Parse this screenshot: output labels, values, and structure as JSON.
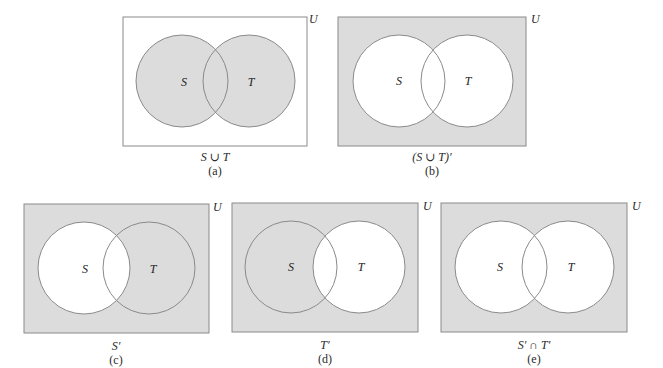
{
  "colors": {
    "shade": "#dcdcdc",
    "white": "#ffffff",
    "stroke": "#8a8a8a",
    "text": "#2a2a2a"
  },
  "universe_label": "U",
  "set_labels": {
    "s": "S",
    "t": "T"
  },
  "diagrams": [
    {
      "id": "a",
      "expression": "S ∪ T",
      "caption": "(a)",
      "shaded_regions": [
        "S only",
        "S ∩ T",
        "T only"
      ],
      "outside_shaded": false,
      "s_shaded": true,
      "t_shaded": true
    },
    {
      "id": "b",
      "expression": "(S ∪ T)′",
      "caption": "(b)",
      "shaded_regions": [
        "outside S and T"
      ],
      "outside_shaded": true,
      "s_shaded": false,
      "t_shaded": false
    },
    {
      "id": "c",
      "expression": "S′",
      "caption": "(c)",
      "shaded_regions": [
        "outside S and T",
        "T only"
      ],
      "outside_shaded": true,
      "s_shaded": false,
      "t_shaded": true
    },
    {
      "id": "d",
      "expression": "T′",
      "caption": "(d)",
      "shaded_regions": [
        "outside S and T",
        "S only"
      ],
      "outside_shaded": true,
      "s_shaded": true,
      "t_shaded": false
    },
    {
      "id": "e",
      "expression": "S′ ∩ T′",
      "caption": "(e)",
      "shaded_regions": [
        "outside S and T"
      ],
      "outside_shaded": true,
      "s_shaded": false,
      "t_shaded": false
    }
  ]
}
